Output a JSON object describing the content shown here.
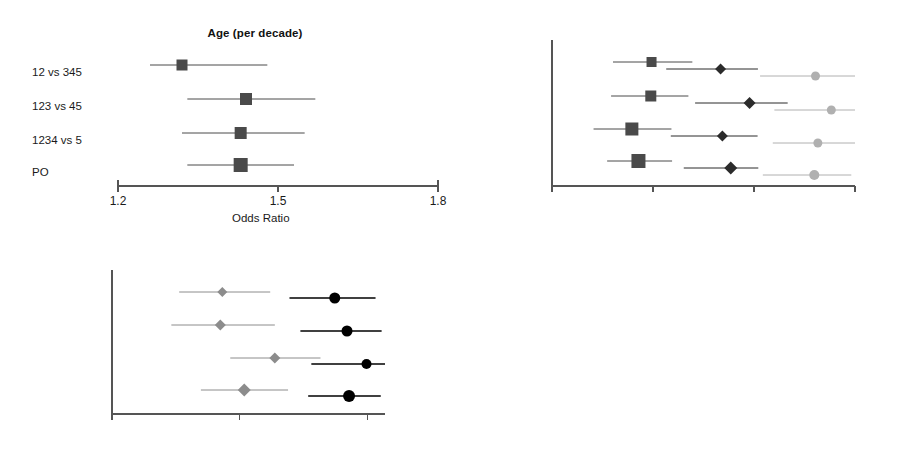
{
  "figure": {
    "type": "forest-plot-grid",
    "background": "#ffffff",
    "width": 901,
    "height": 475,
    "row_labels": [
      "12 vs 345",
      "123 vs 45",
      "1234 vs 5",
      "PO"
    ],
    "axis_title": "Odds Ratio"
  },
  "colors": {
    "dark_square": "#4a4a4a",
    "dark_diamond": "#2b2b2b",
    "light_circle": "#b0b0b0",
    "black_circle": "#000000",
    "mid_diamond": "#8c8c8c",
    "axis": "#555555",
    "text": "#1a1a1a"
  },
  "chart_data": [
    {
      "id": "panel-age",
      "type": "forest",
      "title": "Age (per decade)",
      "xlabel": "Odds Ratio",
      "scale": "linear",
      "xlim": [
        1.2,
        1.8
      ],
      "ticks": [
        1.2,
        1.5,
        1.8
      ],
      "tick_labels": [
        "1.2",
        "1.5",
        "1.8"
      ],
      "categories": [
        "12 vs 345",
        "123 vs 45",
        "1234 vs 5",
        "PO"
      ],
      "series": [
        {
          "name": "Age (per decade)",
          "marker": "square",
          "color": "#4a4a4a",
          "points": [
            {
              "category": "12 vs 345",
              "estimate": 1.32,
              "low": 1.26,
              "high": 1.48,
              "size": 11
            },
            {
              "category": "123 vs 45",
              "estimate": 1.44,
              "low": 1.33,
              "high": 1.57,
              "size": 12
            },
            {
              "category": "1234 vs 5",
              "estimate": 1.43,
              "low": 1.32,
              "high": 1.55,
              "size": 12
            },
            {
              "category": "PO",
              "estimate": 1.43,
              "low": 1.33,
              "high": 1.53,
              "size": 14
            }
          ]
        }
      ]
    },
    {
      "id": "panel-motor",
      "type": "forest",
      "title": "",
      "xlabel": "Odds Ratio",
      "scale": "log",
      "xlim": [
        1,
        8
      ],
      "ticks": [
        1,
        2,
        4,
        8
      ],
      "tick_labels": [
        "1",
        "2",
        "4",
        "8"
      ],
      "categories": [
        "12 vs 345",
        "123 vs 45",
        "1234 vs 5",
        "PO"
      ],
      "group_headers": [
        "Motor=5/6 (ref)",
        "Motor=4",
        "Motor=3",
        "Motor=1/2"
      ],
      "series": [
        {
          "name": "Motor=4",
          "marker": "square",
          "color": "#4a4a4a",
          "points": [
            {
              "category": "12 vs 345",
              "estimate": 1.98,
              "low": 1.52,
              "high": 2.62,
              "size": 10
            },
            {
              "category": "123 vs 45",
              "estimate": 1.97,
              "low": 1.5,
              "high": 2.55,
              "size": 11
            },
            {
              "category": "1234 vs 5",
              "estimate": 1.73,
              "low": 1.33,
              "high": 2.27,
              "size": 13
            },
            {
              "category": "PO",
              "estimate": 1.81,
              "low": 1.46,
              "high": 2.28,
              "size": 14
            }
          ]
        },
        {
          "name": "Motor=3",
          "marker": "diamond",
          "color": "#2b2b2b",
          "points": [
            {
              "category": "12 vs 345",
              "estimate": 3.18,
              "low": 2.19,
              "high": 4.11,
              "size": 9
            },
            {
              "category": "123 vs 45",
              "estimate": 3.88,
              "low": 2.67,
              "high": 5.04,
              "size": 10
            },
            {
              "category": "1234 vs 5",
              "estimate": 3.22,
              "low": 2.26,
              "high": 4.1,
              "size": 9
            },
            {
              "category": "PO",
              "estimate": 3.41,
              "low": 2.47,
              "high": 4.12,
              "size": 11
            }
          ]
        },
        {
          "name": "Motor=1/2",
          "marker": "circle",
          "color": "#b0b0b0",
          "points": [
            {
              "category": "12 vs 345",
              "estimate": 6.1,
              "low": 4.17,
              "high": 8.1,
              "size": 9
            },
            {
              "category": "123 vs 45",
              "estimate": 6.8,
              "low": 4.6,
              "high": 8.4,
              "size": 9
            },
            {
              "category": "1234 vs 5",
              "estimate": 6.2,
              "low": 4.55,
              "high": 8.3,
              "size": 9
            },
            {
              "category": "PO",
              "estimate": 6.05,
              "low": 4.25,
              "high": 7.8,
              "size": 10
            }
          ]
        }
      ]
    },
    {
      "id": "panel-pupil",
      "type": "forest",
      "title": "",
      "xlabel": "Odds Ratio",
      "scale": "log",
      "xlim": [
        1,
        4.4
      ],
      "ticks": [
        1,
        2,
        4
      ],
      "tick_labels": [
        "1",
        "2",
        "4"
      ],
      "categories": [
        "12 vs 345",
        "123 vs 45",
        "1234 vs 5",
        "PO"
      ],
      "group_headers": [
        "Pupil=0 (ref)",
        "1 unresponsive",
        "both unresponsive"
      ],
      "series": [
        {
          "name": "1 unresponsive",
          "marker": "diamond",
          "color": "#8c8c8c",
          "points": [
            {
              "category": "12 vs 345",
              "estimate": 1.82,
              "low": 1.44,
              "high": 2.36,
              "size": 8
            },
            {
              "category": "123 vs 45",
              "estimate": 1.8,
              "low": 1.38,
              "high": 2.42,
              "size": 9
            },
            {
              "category": "1234 vs 5",
              "estimate": 2.42,
              "low": 1.9,
              "high": 3.1,
              "size": 9
            },
            {
              "category": "PO",
              "estimate": 2.05,
              "low": 1.62,
              "high": 2.6,
              "size": 11
            }
          ]
        },
        {
          "name": "both unresponsive",
          "marker": "circle",
          "color": "#000000",
          "points": [
            {
              "category": "12 vs 345",
              "estimate": 3.35,
              "low": 2.62,
              "high": 4.18,
              "size": 11
            },
            {
              "category": "123 vs 45",
              "estimate": 3.58,
              "low": 2.78,
              "high": 4.32,
              "size": 11
            },
            {
              "category": "1234 vs 5",
              "estimate": 3.98,
              "low": 2.95,
              "high": 4.4,
              "size": 10
            },
            {
              "category": "PO",
              "estimate": 3.62,
              "low": 2.9,
              "high": 4.3,
              "size": 12
            }
          ]
        }
      ]
    }
  ]
}
